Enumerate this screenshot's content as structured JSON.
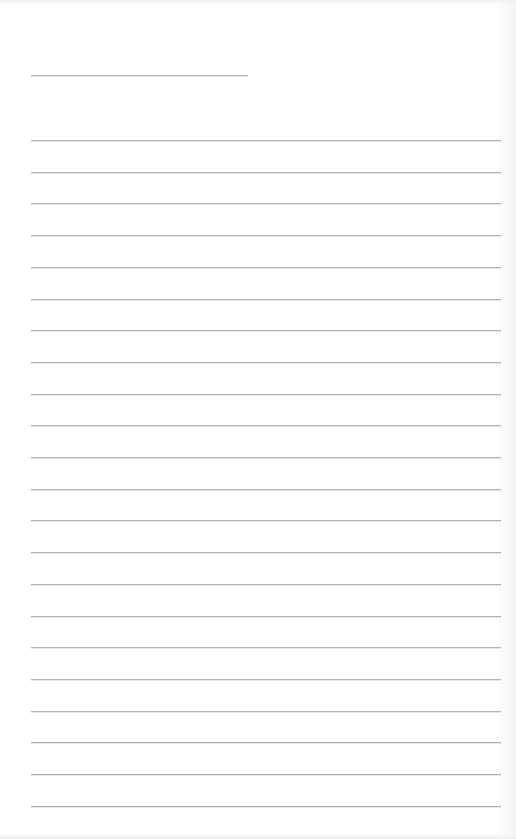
{
  "document": {
    "type": "lined-paper",
    "background_color": "#ffffff",
    "line_color": "#b4b4b4",
    "name_line": {
      "x": 31,
      "y": 75,
      "width": 217
    },
    "ruled_lines": {
      "x": 31,
      "width": 470,
      "first_y": 140,
      "spacing": 31.7,
      "count": 22
    },
    "text": []
  }
}
